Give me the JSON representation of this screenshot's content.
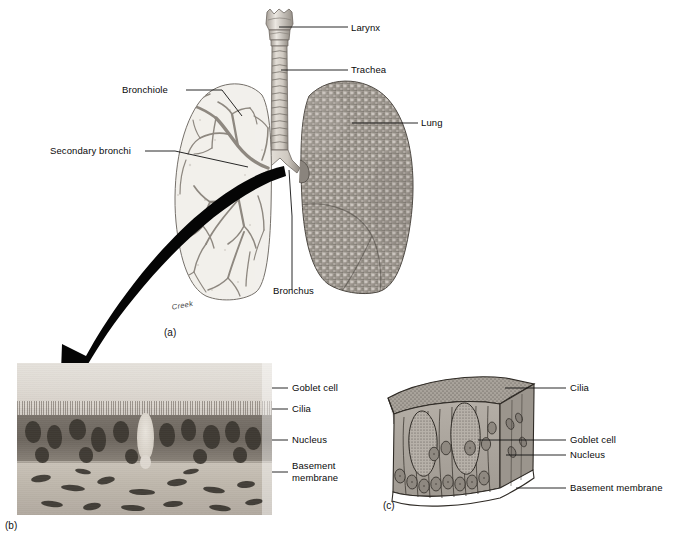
{
  "figure": {
    "artist_signature": "Creek",
    "background_color": "#ffffff",
    "ink_color": "#111111"
  },
  "panels": [
    {
      "id": "a",
      "caption": "(a)",
      "description": "Anterior view of larynx, trachea and lungs; left lung shown with internal bronchial tree, right lung shown as whole organ",
      "labels": [
        {
          "key": "larynx",
          "text": "Larynx"
        },
        {
          "key": "trachea",
          "text": "Trachea"
        },
        {
          "key": "lung",
          "text": "Lung"
        },
        {
          "key": "bronchiole",
          "text": "Bronchiole"
        },
        {
          "key": "secondary_bronchi",
          "text": "Secondary bronchi"
        },
        {
          "key": "bronchus",
          "text": "Bronchus"
        }
      ]
    },
    {
      "id": "b",
      "caption": "(b)",
      "description": "Light micrograph of pseudostratified ciliated columnar epithelium lining the trachea",
      "labels": [
        {
          "key": "goblet_cell",
          "text": "Goblet cell"
        },
        {
          "key": "cilia",
          "text": "Cilia"
        },
        {
          "key": "nucleus",
          "text": "Nucleus"
        },
        {
          "key": "basement_membrane",
          "text": "Basement\nmembrane"
        }
      ]
    },
    {
      "id": "c",
      "caption": "(c)",
      "description": "Three-dimensional block diagram of pseudostratified ciliated columnar epithelium",
      "labels": [
        {
          "key": "cilia",
          "text": "Cilia"
        },
        {
          "key": "goblet_cell",
          "text": "Goblet cell"
        },
        {
          "key": "nucleus",
          "text": "Nucleus"
        },
        {
          "key": "basement_membrane",
          "text": "Basement membrane"
        }
      ]
    }
  ],
  "arrow": {
    "name": "magnification-arrow",
    "description": "Large curved black arrow leading from the bronchus region of panel (a) down-left into the micrograph of panel (b)"
  }
}
